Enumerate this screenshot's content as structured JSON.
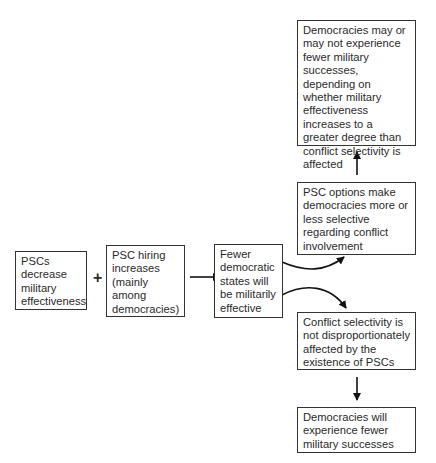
{
  "diagram": {
    "nodes": [
      {
        "id": "psc-decrease",
        "text": "PSCs decrease military effectiveness"
      },
      {
        "id": "psc-hiring",
        "text": "PSC hiring increases (mainly among democracies)"
      },
      {
        "id": "fewer-effective",
        "text": "Fewer democratic states will be militarily effective"
      },
      {
        "id": "selectivity-change",
        "text": "PSC options make democracies more or less selective regarding conflict involvement"
      },
      {
        "id": "may-or-may-not",
        "text": "Democracies may or may not experience fewer military successes, depending on whether military effectiveness increases to a greater degree than conflict selectivity is affected"
      },
      {
        "id": "selectivity-unaffected",
        "text": "Conflict selectivity is not disproportionately affected by the existence of PSCs"
      },
      {
        "id": "fewer-successes",
        "text": "Democracies will experience fewer military successes"
      }
    ],
    "plus_symbol": "+",
    "edges": [
      {
        "from": "psc-hiring",
        "to": "fewer-effective",
        "type": "straight-arrow"
      },
      {
        "from": "fewer-effective",
        "to": "selectivity-change",
        "type": "curved-arrow"
      },
      {
        "from": "fewer-effective",
        "to": "selectivity-unaffected",
        "type": "curved-arrow"
      },
      {
        "from": "selectivity-change",
        "to": "may-or-may-not",
        "type": "straight-arrow"
      },
      {
        "from": "selectivity-unaffected",
        "to": "fewer-successes",
        "type": "straight-arrow"
      }
    ]
  }
}
